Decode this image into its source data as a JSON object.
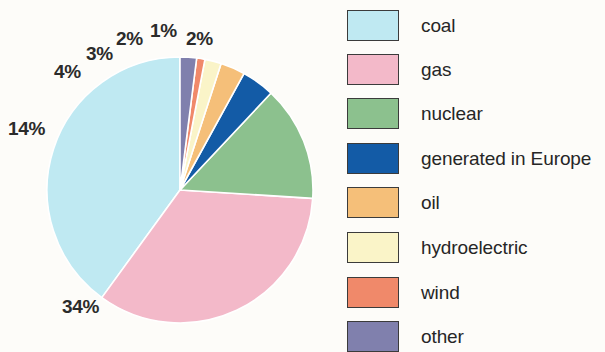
{
  "chart_data": {
    "type": "pie",
    "title": "",
    "subtitle": "",
    "xlabel": "",
    "ylabel": "",
    "legend_position": "right",
    "grid": false,
    "unit": "%",
    "start_angle_deg": 0,
    "direction": "counterclockwise-from-top",
    "categories": [
      "coal",
      "gas",
      "nuclear",
      "generated in Europe",
      "oil",
      "hydroelectric",
      "wind",
      "other"
    ],
    "values": [
      40,
      34,
      14,
      4,
      3,
      2,
      1,
      2
    ],
    "labels": [
      "",
      "34%",
      "14%",
      "4%",
      "3%",
      "2%",
      "1%",
      "2%"
    ],
    "colors": [
      "#bfe9f2",
      "#f3b9c9",
      "#8cc18e",
      "#135ba6",
      "#f5bf79",
      "#faf4c8",
      "#f0896a",
      "#8080ad"
    ],
    "slices": [
      {
        "name": "coal",
        "value": 40,
        "label": "",
        "color": "#bfe9f2"
      },
      {
        "name": "gas",
        "value": 34,
        "label": "34%",
        "color": "#f3b9c9"
      },
      {
        "name": "nuclear",
        "value": 14,
        "label": "14%",
        "color": "#8cc18e"
      },
      {
        "name": "generated in Europe",
        "value": 4,
        "label": "4%",
        "color": "#135ba6"
      },
      {
        "name": "oil",
        "value": 3,
        "label": "3%",
        "color": "#f5bf79"
      },
      {
        "name": "hydroelectric",
        "value": 2,
        "label": "2%",
        "color": "#faf4c8"
      },
      {
        "name": "wind",
        "value": 1,
        "label": "1%",
        "color": "#f0896a"
      },
      {
        "name": "other",
        "value": 2,
        "label": "2%",
        "color": "#8080ad"
      }
    ]
  },
  "pie": {
    "center_x": 180,
    "center_y": 190,
    "radius": 133,
    "labels": [
      {
        "text": "34%",
        "x": 62,
        "y": 297
      },
      {
        "text": "14%",
        "x": 8,
        "y": 119
      },
      {
        "text": "4%",
        "x": 54,
        "y": 62
      },
      {
        "text": "3%",
        "x": 86,
        "y": 44
      },
      {
        "text": "2%",
        "x": 116,
        "y": 29
      },
      {
        "text": "1%",
        "x": 150,
        "y": 21
      },
      {
        "text": "2%",
        "x": 186,
        "y": 29
      }
    ]
  },
  "legend": {
    "items": [
      {
        "label": "coal",
        "color": "#bfe9f2",
        "top": 9
      },
      {
        "label": "gas",
        "color": "#f3b9c9",
        "top": 53
      },
      {
        "label": "nuclear",
        "color": "#8cc18e",
        "top": 97
      },
      {
        "label": "generated in Europe",
        "color": "#135ba6",
        "top": 142
      },
      {
        "label": "oil",
        "color": "#f5bf79",
        "top": 186
      },
      {
        "label": "hydroelectric",
        "color": "#faf4c8",
        "top": 231
      },
      {
        "label": "wind",
        "color": "#f0896a",
        "top": 276
      },
      {
        "label": "other",
        "color": "#8080ad",
        "top": 320
      }
    ]
  },
  "colors": {
    "background": "#fdfcf9",
    "text": "#262626",
    "swatch_border": "#3b3b3b",
    "slice_divider": "#ffffff"
  }
}
